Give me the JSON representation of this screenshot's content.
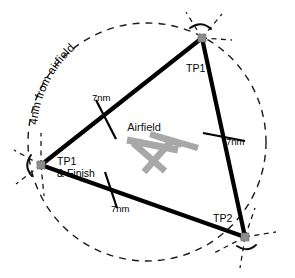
{
  "diagram": {
    "background_color": "#ffffff",
    "ink_color": "#000000",
    "airfield_symbol_color": "#a8a8a8",
    "vertex_marker_color": "#8c8c8c",
    "circle": {
      "label": "4nm from airfield",
      "style": "dashed",
      "center_label": "Airfield"
    },
    "center": {
      "label": "Airfield"
    },
    "turning_points": [
      {
        "id": "tp1-top",
        "label": "TP1"
      },
      {
        "id": "tp1-finish-left",
        "label_line1": "TP1",
        "label_line2": "& Finish"
      },
      {
        "id": "tp2-bottom-right",
        "label": "TP2"
      }
    ],
    "legs": [
      {
        "id": "leg-left",
        "label": "7nm"
      },
      {
        "id": "leg-right",
        "label": "7nm"
      },
      {
        "id": "leg-bottom",
        "label": "7nm"
      }
    ]
  }
}
